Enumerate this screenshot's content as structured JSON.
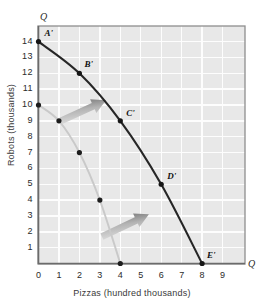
{
  "chart_data": {
    "type": "line",
    "title": "",
    "xlabel": "Pizzas (hundred thousands)",
    "ylabel": "Robots (thousands)",
    "xlim": [
      0,
      9.6
    ],
    "ylim": [
      0,
      14.6
    ],
    "xticks": [
      "0",
      "1",
      "2",
      "3",
      "4",
      "5",
      "6",
      "7",
      "8",
      "9"
    ],
    "yticks": [
      "1",
      "2",
      "3",
      "4",
      "5",
      "6",
      "7",
      "8",
      "9",
      "10",
      "11",
      "12",
      "13",
      "14"
    ],
    "grid": true,
    "legend": null,
    "axis_end_labels": {
      "y_top": "Q",
      "x_right": "Q"
    },
    "series": [
      {
        "name": "new-ppf",
        "style": "dark",
        "color": "#262626",
        "points": [
          {
            "x": 0,
            "y": 14,
            "label": "A'"
          },
          {
            "x": 2,
            "y": 12,
            "label": "B'"
          },
          {
            "x": 4,
            "y": 9,
            "label": "C'"
          },
          {
            "x": 6,
            "y": 5,
            "label": "D'"
          },
          {
            "x": 8,
            "y": 0,
            "label": "E'"
          }
        ]
      },
      {
        "name": "original-ppf",
        "style": "light",
        "color": "#c9c9c9",
        "points": [
          {
            "x": 0,
            "y": 10,
            "label": ""
          },
          {
            "x": 1,
            "y": 9,
            "label": ""
          },
          {
            "x": 2,
            "y": 7,
            "label": ""
          },
          {
            "x": 3,
            "y": 4,
            "label": ""
          },
          {
            "x": 4,
            "y": 0,
            "label": ""
          }
        ]
      }
    ],
    "annotations": [
      {
        "name": "shift-arrow-upper",
        "from": {
          "x": 1.1,
          "y": 9.0
        },
        "to": {
          "x": 3.3,
          "y": 10.3
        }
      },
      {
        "name": "shift-arrow-lower",
        "from": {
          "x": 3.1,
          "y": 1.7
        },
        "to": {
          "x": 5.4,
          "y": 3.1
        }
      }
    ]
  },
  "point_labels": {
    "a": "A'",
    "b": "B'",
    "c": "C'",
    "d": "D'",
    "e": "E'"
  }
}
